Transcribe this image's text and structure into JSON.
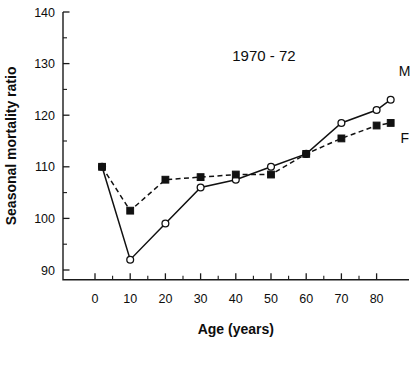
{
  "chart_data": {
    "type": "line",
    "title": "1970 - 72",
    "xlabel": "Age (years)",
    "ylabel": "Seasonal mortality ratio",
    "xlim": [
      -2,
      88
    ],
    "ylim": [
      85,
      140
    ],
    "grid": false,
    "legend_position": "inline-right",
    "x_ticks": [
      0,
      10,
      20,
      30,
      40,
      50,
      60,
      70,
      80
    ],
    "x_tick_labels": [
      "0",
      "10",
      "20",
      "30",
      "40",
      "50",
      "60",
      "70",
      "80"
    ],
    "x_minor_step": 5,
    "y_ticks": [
      90,
      100,
      110,
      120,
      130,
      140
    ],
    "y_tick_labels": [
      "90",
      "100",
      "110",
      "120",
      "130",
      "140"
    ],
    "y_minor_step": 5,
    "series": [
      {
        "name": "M",
        "label": "M",
        "marker": "open-circle",
        "linestyle": "solid",
        "color": "#111111",
        "x": [
          2,
          10,
          20,
          30,
          40,
          50,
          60,
          70,
          80,
          84
        ],
        "values": [
          110,
          92,
          99,
          106,
          107.5,
          110,
          112.5,
          118.5,
          121,
          123
        ]
      },
      {
        "name": "F",
        "label": "F",
        "marker": "filled-square",
        "linestyle": "dashed",
        "color": "#111111",
        "x": [
          2,
          10,
          20,
          30,
          40,
          50,
          60,
          70,
          80,
          84
        ],
        "values": [
          110,
          101.5,
          107.5,
          108,
          108.5,
          108.5,
          112.5,
          115.5,
          118,
          118.5
        ]
      }
    ],
    "annotations": [
      {
        "text": "M",
        "x": 84,
        "y": 128.5
      },
      {
        "text": "F",
        "x": 84,
        "y": 115.5
      }
    ]
  }
}
